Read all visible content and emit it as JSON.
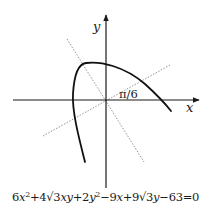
{
  "diagram": {
    "type": "rotated-conic-parabola",
    "axes": {
      "x_label": "x",
      "y_label": "y",
      "origin_px": [
        106,
        100
      ]
    },
    "rotation_angle_label": "π/6",
    "rotated_axes_style": "dotted",
    "curve": "parabola opening down-left, vertex upper-left of origin",
    "colors": {
      "axes": "#1a1a1a",
      "curve": "#111111",
      "dotted": "#888888"
    }
  },
  "equation": {
    "parts": [
      "6",
      "x",
      "2",
      "+4",
      "√3",
      "xy",
      "+2",
      "y",
      "2",
      "−9",
      "x",
      "+9",
      "√3",
      "y",
      "−63=0"
    ],
    "plain": "6x²+4√3xy+2y²−9x+9√3y−63=0"
  }
}
